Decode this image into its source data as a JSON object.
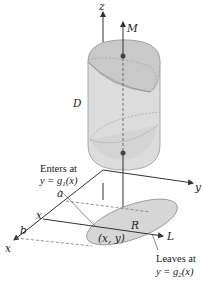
{
  "diagram": {
    "type": "3d-region-projection",
    "labels": {
      "z_axis": "z",
      "y_axis": "y",
      "x_axis": "x",
      "top_point": "M",
      "solid": "D",
      "region": "R",
      "point": "(x, y)",
      "line": "L",
      "a": "a",
      "b": "b",
      "x_tick": "x"
    },
    "annotations": {
      "enters_line1": "Enters at",
      "enters_line2": "y = g",
      "enters_sub": "1",
      "enters_tail": "(x)",
      "leaves_line1": "Leaves at",
      "leaves_line2": "y = g",
      "leaves_sub": "2",
      "leaves_tail": "(x)"
    },
    "colors": {
      "solid_fill": "#d9d9d9",
      "solid_cap": "#c8c8c8",
      "region_fill": "#d6d6d6",
      "line": "#333333",
      "dashed": "#777777"
    }
  }
}
